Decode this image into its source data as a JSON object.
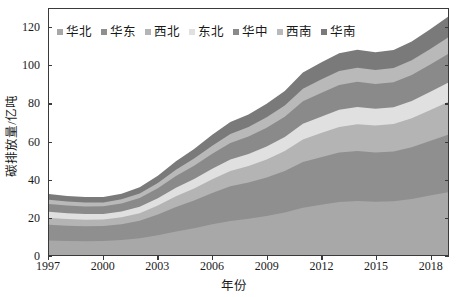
{
  "chart_data": {
    "type": "area",
    "stacked": true,
    "title": "",
    "xlabel": "年份",
    "ylabel": "碳排放量/亿吨",
    "xlim": [
      1997,
      2019
    ],
    "ylim": [
      0,
      130
    ],
    "grid": false,
    "legend_position": "top-left",
    "x": [
      1997,
      1998,
      1999,
      2000,
      2001,
      2002,
      2003,
      2004,
      2005,
      2006,
      2007,
      2008,
      2009,
      2010,
      2011,
      2012,
      2013,
      2014,
      2015,
      2016,
      2017,
      2018,
      2019
    ],
    "xticks": [
      "1997",
      "2000",
      "2003",
      "2006",
      "2009",
      "2012",
      "2015",
      "2018"
    ],
    "xtick_values": [
      1997,
      2000,
      2003,
      2006,
      2009,
      2012,
      2015,
      2018
    ],
    "yticks": [
      "0",
      "20",
      "40",
      "60",
      "80",
      "100",
      "120"
    ],
    "ytick_values": [
      0,
      20,
      40,
      60,
      80,
      100,
      120
    ],
    "series": [
      {
        "name": "华北",
        "color": "#a8a8a8",
        "values": [
          7.6,
          7.4,
          7.3,
          7.4,
          7.9,
          8.8,
          10.4,
          12.4,
          14.2,
          16.2,
          18.0,
          19.2,
          20.6,
          22.4,
          25.0,
          26.6,
          28.0,
          28.6,
          28.2,
          28.4,
          29.6,
          31.4,
          33.2
        ]
      },
      {
        "name": "华东",
        "color": "#8f8f8f",
        "values": [
          8.4,
          8.1,
          7.9,
          7.9,
          8.4,
          9.3,
          11.0,
          13.0,
          14.6,
          16.5,
          18.3,
          19.1,
          20.4,
          22.0,
          24.2,
          25.1,
          26.1,
          26.4,
          26.0,
          26.3,
          27.3,
          28.8,
          30.3
        ]
      },
      {
        "name": "西北",
        "color": "#b4b4b4",
        "values": [
          3.6,
          3.5,
          3.4,
          3.4,
          3.6,
          4.0,
          4.7,
          5.6,
          6.4,
          7.3,
          8.1,
          8.7,
          9.5,
          10.5,
          11.9,
          12.8,
          13.6,
          14.1,
          14.2,
          14.5,
          15.3,
          16.3,
          17.4
        ]
      },
      {
        "name": "东北",
        "color": "#e0e0e0",
        "values": [
          3.2,
          3.1,
          3.0,
          3.0,
          3.1,
          3.4,
          3.9,
          4.5,
          5.0,
          5.6,
          6.1,
          6.4,
          6.9,
          7.4,
          8.2,
          8.6,
          9.0,
          9.1,
          8.9,
          8.9,
          9.2,
          9.6,
          10.1
        ]
      },
      {
        "name": "华中",
        "color": "#8a8a8a",
        "values": [
          4.2,
          4.1,
          4.0,
          4.0,
          4.2,
          4.6,
          5.3,
          6.2,
          7.0,
          7.9,
          8.7,
          9.2,
          9.9,
          10.7,
          11.9,
          12.5,
          13.1,
          13.3,
          13.1,
          13.2,
          13.7,
          14.4,
          15.2
        ]
      },
      {
        "name": "西南",
        "color": "#b9b9b9",
        "values": [
          2.2,
          2.1,
          2.1,
          2.1,
          2.2,
          2.4,
          2.8,
          3.3,
          3.8,
          4.3,
          4.8,
          5.1,
          5.5,
          6.0,
          6.7,
          7.1,
          7.4,
          7.5,
          7.4,
          7.5,
          7.8,
          8.2,
          8.7
        ]
      },
      {
        "name": "华南",
        "color": "#7a7a7a",
        "values": [
          3.0,
          2.9,
          2.9,
          2.9,
          3.0,
          3.3,
          3.8,
          4.5,
          5.0,
          5.7,
          6.3,
          6.6,
          7.1,
          7.7,
          8.5,
          9.0,
          9.4,
          9.5,
          9.4,
          9.5,
          9.9,
          10.4,
          11.0
        ]
      }
    ]
  },
  "axis": {
    "y_title": "碳排放量/亿吨",
    "x_title": "年份"
  }
}
